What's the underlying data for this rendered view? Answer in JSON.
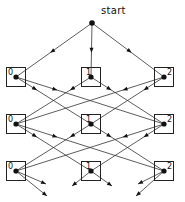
{
  "diagram": {
    "start_label": "start",
    "start_point": {
      "x": 92,
      "y": 23
    },
    "columns_x": [
      16,
      91,
      164
    ],
    "rows_y": [
      77,
      124,
      171
    ],
    "box_size": 19,
    "node_labels": [
      "0",
      "1",
      "2"
    ],
    "rows": [
      {
        "row": 0,
        "nodes": [
          "0",
          "1",
          "2"
        ]
      },
      {
        "row": 1,
        "nodes": [
          "0",
          "1",
          "2"
        ]
      },
      {
        "row": 2,
        "nodes": [
          "0",
          "1",
          "2"
        ]
      }
    ],
    "edge_rule": "each node connects to the two other-labeled nodes in the next row",
    "start_edges_to": [
      "0",
      "1",
      "2"
    ],
    "bottom_stubs": [
      {
        "from": "0",
        "to": {
          "x": 46,
          "y": 184
        }
      },
      {
        "from": "0",
        "to": {
          "x": 47,
          "y": 196
        }
      },
      {
        "from": "1",
        "to": {
          "x": 72,
          "y": 186
        }
      },
      {
        "from": "1",
        "to": {
          "x": 112,
          "y": 186
        }
      },
      {
        "from": "2",
        "to": {
          "x": 138,
          "y": 184
        }
      },
      {
        "from": "2",
        "to": {
          "x": 136,
          "y": 196
        }
      }
    ],
    "colors": {
      "line": "#333333",
      "node": "#111111",
      "box": "#222222"
    }
  }
}
